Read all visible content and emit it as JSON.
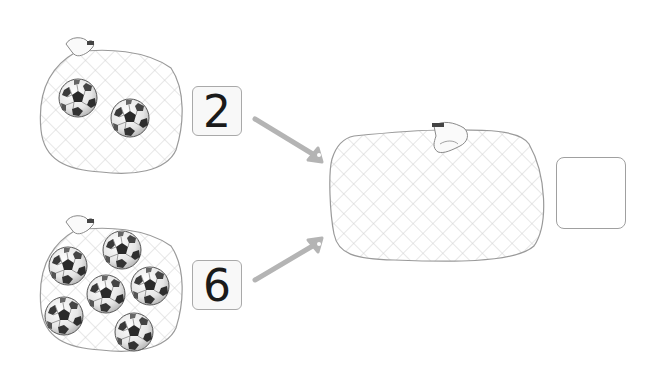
{
  "problem": {
    "top_group": {
      "count_label": "2",
      "balls": 2
    },
    "bottom_group": {
      "count_label": "6",
      "balls": 6
    },
    "result": {
      "answer_value": "",
      "bag": "empty-combined-net-bag"
    }
  },
  "colors": {
    "net_line": "#c8c8c8",
    "bag_outline": "#9a9a9a",
    "arrow": "#b4b4b4",
    "box_border": "#a9a9a9",
    "digit": "#1a1a1a"
  },
  "icons": {
    "bag": "net-bag-icon",
    "ball": "soccer-ball-icon",
    "arrow": "arrow-icon"
  }
}
